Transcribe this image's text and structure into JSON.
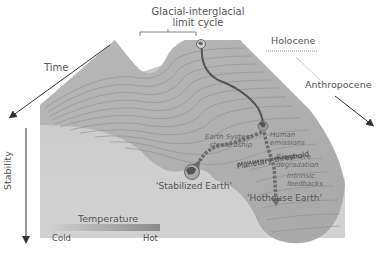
{
  "figure": {
    "title_line1": "Glacial-interglacial",
    "title_line2": "limit cycle",
    "axes": {
      "time_label": "Time",
      "stability_label": "Stability"
    },
    "epochs": {
      "holocene": "Holocene",
      "anthropocene": "Anthropocene"
    },
    "annotations": {
      "earth_system_line1": "Earth System",
      "earth_system_line2": "stewardship",
      "human_line1": "Human",
      "human_line2": "emissions",
      "biosphere_line1": "Biosphere",
      "biosphere_line2": "degradation",
      "planetary_threshold": "Planetary threshold",
      "intrinsic_line1": "Intrinsic",
      "intrinsic_line2": "feedbacks"
    },
    "states": {
      "stabilized_earth": "'Stabilized Earth'",
      "hothouse_earth": "'Hothouse Earth'"
    },
    "legend": {
      "title": "Temperature",
      "cold": "Cold",
      "hot": "Hot",
      "gradient_colors": [
        "#c9c9c9",
        "#8a8a8a"
      ]
    },
    "colors": {
      "surface": "#bdbdbd",
      "surface_dark": "#a9a9a9",
      "contour": "#8c8c8c",
      "path_solid": "#555555",
      "path_dashed": "#6e6e6e"
    }
  }
}
